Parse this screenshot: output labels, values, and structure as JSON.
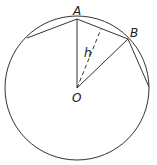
{
  "labels": {
    "A": "A",
    "B": "B",
    "O": "O",
    "h": "h"
  },
  "colors": {
    "stroke": "#333333",
    "background": "#ffffff"
  }
}
